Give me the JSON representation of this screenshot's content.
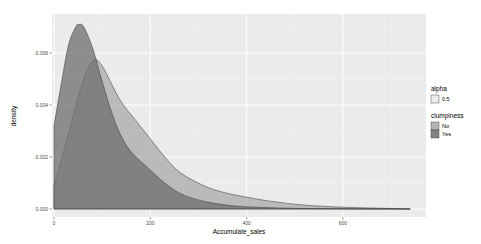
{
  "chart_data": {
    "type": "area",
    "subtype": "density",
    "title": "",
    "xlabel": "Accumulate_sales",
    "ylabel": "density",
    "xlim": [
      -10,
      770
    ],
    "ylim": [
      -0.0003,
      0.0075
    ],
    "x_ticks": [
      0,
      200,
      400,
      600
    ],
    "x_tick_labels": [
      "0",
      "200",
      "400",
      "600"
    ],
    "y_ticks": [
      0.0,
      0.002,
      0.004,
      0.006
    ],
    "y_tick_labels": [
      "0.000",
      "0.002",
      "0.004",
      "0.006"
    ],
    "grid": true,
    "legend_position": "right",
    "series": [
      {
        "name": "No",
        "color": "#a9a9a9",
        "x": [
          0,
          20,
          40,
          60,
          81,
          100,
          137,
          170,
          200,
          230,
          262,
          304,
          340,
          387,
          450,
          520,
          600,
          680,
          740
        ],
        "y": [
          0.0009,
          0.0022,
          0.0036,
          0.0049,
          0.0057,
          0.0055,
          0.0042,
          0.0034,
          0.0027,
          0.002,
          0.0014,
          0.00096,
          0.0007,
          0.0005,
          0.0003,
          0.00015,
          7e-05,
          3e-05,
          0.0
        ]
      },
      {
        "name": "Yes",
        "color": "#6e6e6e",
        "x": [
          0,
          15,
          30,
          45,
          52,
          62,
          80,
          100,
          120,
          137,
          160,
          200,
          230,
          262,
          300,
          340,
          387,
          450,
          520,
          600,
          740
        ],
        "y": [
          0.0032,
          0.0048,
          0.0063,
          0.007,
          0.0071,
          0.007,
          0.0062,
          0.0049,
          0.0037,
          0.0029,
          0.0022,
          0.0015,
          0.001,
          0.0006,
          0.00035,
          0.0002,
          0.0001,
          5e-05,
          2e-05,
          1e-05,
          0.0
        ]
      }
    ],
    "legends": [
      {
        "title": "alpha",
        "entries": [
          {
            "label": "0.5",
            "color": "#ebebeb"
          }
        ]
      },
      {
        "title": "clumpiness",
        "entries": [
          {
            "label": "No",
            "color": "#a9a9a9"
          },
          {
            "label": "Yes",
            "color": "#6e6e6e"
          }
        ]
      }
    ]
  }
}
